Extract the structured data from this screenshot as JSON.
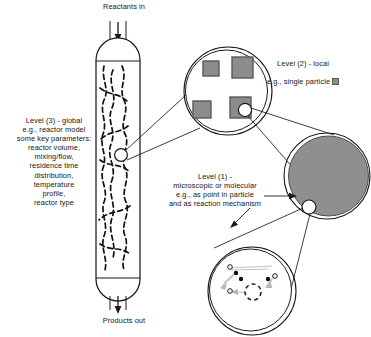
{
  "figure": {
    "labels": {
      "reactants_in": "Reactants in",
      "products_out": "Products out",
      "level3": "Level (3) - global\ne.g., reactor model\nsome key parameters:\nreactor volume,\nmixing/flow,\nresidence time\ndistribution,\ntemperature\nprofile,\nreactor type",
      "level2_line1": "Level (2) - local",
      "level2_line2": "e.g., single particle",
      "level1": "Level (1) -\nmicroscopic or molecular\ne.g., as point in particle\nand as reaction mechanism"
    }
  },
  "levels": [
    {
      "id": "level-3",
      "name": "global",
      "number": "3",
      "subject": "reactor model",
      "parameters": [
        "reactor volume",
        "mixing/flow",
        "residence time distribution",
        "temperature profile",
        "reactor type"
      ]
    },
    {
      "id": "level-2",
      "name": "local",
      "number": "2",
      "subject": "single particle",
      "particle_count": 4
    },
    {
      "id": "level-1",
      "name": "microscopic or molecular",
      "number": "1",
      "subject": "as point in particle and as reaction mechanism"
    }
  ],
  "colors": {
    "stroke": "#1a1a1a",
    "particle_fill": "#8c8c8c",
    "particle_stroke": "#595959",
    "big_particle_fill": "#8f8f8f",
    "background": "#ffffff",
    "faint": "#b5b5b5"
  }
}
